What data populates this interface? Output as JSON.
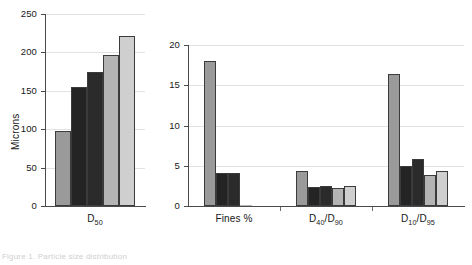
{
  "figure": {
    "caption": "Figure 1. Particle size distribution",
    "series_colors": [
      "#9a9a9a",
      "#242424",
      "#2b2b2b",
      "#b4b4b4",
      "#cfcfcf"
    ],
    "series_names": [
      "Sample 1",
      "Sample 2",
      "Sample 3",
      "Sample 4",
      "Sample 5"
    ]
  },
  "chart_data": [
    {
      "type": "bar",
      "title": "",
      "xlabel": "",
      "ylabel": "Microns",
      "categories": [
        "D50"
      ],
      "category_labels_html": [
        "D<sub>50</sub>"
      ],
      "ylim": [
        0,
        250
      ],
      "yticks": [
        0,
        50,
        100,
        150,
        200,
        250
      ],
      "ytick_labels": [
        "0",
        "50",
        "100",
        "150",
        "200",
        "250"
      ],
      "grid": true,
      "legend": "none",
      "series": [
        {
          "name": "Sample 1",
          "values": [
            98
          ]
        },
        {
          "name": "Sample 2",
          "values": [
            155
          ]
        },
        {
          "name": "Sample 3",
          "values": [
            175
          ]
        },
        {
          "name": "Sample 4",
          "values": [
            196
          ]
        },
        {
          "name": "Sample 5",
          "values": [
            222
          ]
        }
      ]
    },
    {
      "type": "bar",
      "title": "",
      "xlabel": "",
      "ylabel": "",
      "categories": [
        "Fines %",
        "D40/D90",
        "D10/D95"
      ],
      "category_labels_html": [
        "Fines %",
        "D<sub>40</sub>/D<sub>90</sub>",
        "D<sub>10</sub>/D<sub>95</sub>"
      ],
      "ylim": [
        0,
        20
      ],
      "yticks": [
        0,
        5,
        10,
        15,
        20
      ],
      "ytick_labels": [
        "0",
        "5",
        "10",
        "15",
        "20"
      ],
      "grid": true,
      "legend": "none",
      "series": [
        {
          "name": "Sample 1",
          "values": [
            18.0,
            4.3,
            16.4
          ]
        },
        {
          "name": "Sample 2",
          "values": [
            4.1,
            2.4,
            5.0
          ]
        },
        {
          "name": "Sample 3",
          "values": [
            4.1,
            2.5,
            5.8
          ]
        },
        {
          "name": "Sample 4",
          "values": [
            0.1,
            2.2,
            3.9
          ]
        },
        {
          "name": "Sample 5",
          "values": [
            0.0,
            2.5,
            4.4
          ]
        }
      ]
    }
  ]
}
